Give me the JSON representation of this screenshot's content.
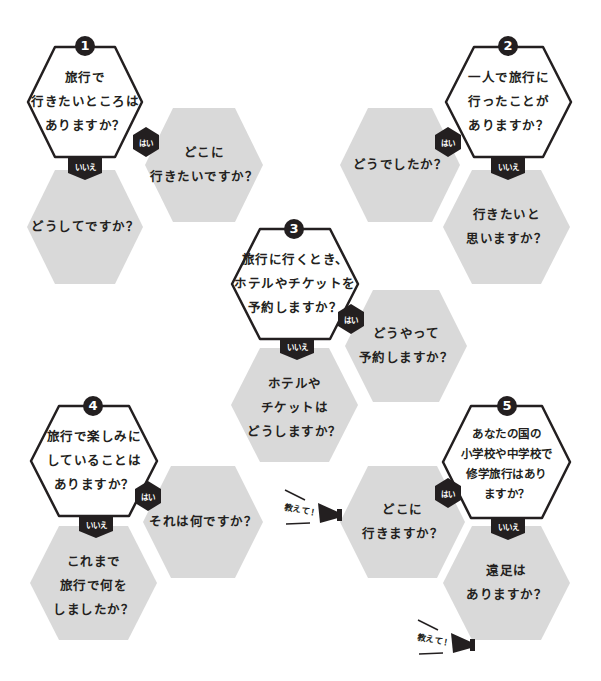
{
  "colors": {
    "ink": "#231f20",
    "gray_hex": "#d9d9d9",
    "white_hex": "#ffffff"
  },
  "labels": {
    "yes": "はい",
    "no": "いいえ",
    "tell_me": "教えて！"
  },
  "questions": [
    {
      "number": "1",
      "question": [
        "旅行で",
        "行きたいところは",
        "ありますか？"
      ],
      "yes_followup": [
        "どこに",
        "行きたいですか？"
      ],
      "no_followup": [
        "どうしてですか？"
      ]
    },
    {
      "number": "2",
      "question": [
        "一人で旅行に",
        "行ったことが",
        "ありますか？"
      ],
      "yes_followup": [
        "どうでしたか？"
      ],
      "no_followup": [
        "行きたいと",
        "思いますか？"
      ]
    },
    {
      "number": "3",
      "question": [
        "旅行に行くとき、",
        "ホテルやチケットを",
        "予約しますか？"
      ],
      "yes_followup": [
        "どうやって",
        "予約しますか？"
      ],
      "no_followup": [
        "ホテルや",
        "チケットは",
        "どうしますか？"
      ]
    },
    {
      "number": "4",
      "question": [
        "旅行で楽しみに",
        "していることは",
        "ありますか？"
      ],
      "yes_followup": [
        "それは何ですか？"
      ],
      "no_followup": [
        "これまで",
        "旅行で何を",
        "しましたか？"
      ]
    },
    {
      "number": "5",
      "question": [
        "あなたの国の",
        "小学校や中学校で",
        "修学旅行はあり",
        "ますか？"
      ],
      "yes_followup": [
        "どこに",
        "行きますか？"
      ],
      "no_followup": [
        "遠足は",
        "ありますか？"
      ]
    }
  ]
}
